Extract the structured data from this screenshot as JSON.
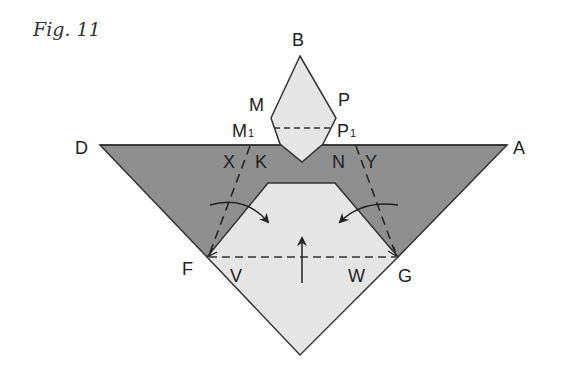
{
  "figure": {
    "title": "Fig. 11",
    "colors": {
      "dark_fill": "#8f8f8f",
      "light_fill": "#e6e6e6",
      "stroke": "#333333",
      "background": "#ffffff"
    },
    "labels": {
      "B": "B",
      "M": "M",
      "P": "P",
      "M1": "M",
      "M1_sub": "1",
      "P1": "P",
      "P1_sub": "1",
      "D": "D",
      "A": "A",
      "X": "X",
      "K": "K",
      "N": "N",
      "Y": "Y",
      "F": "F",
      "V": "V",
      "W": "W",
      "G": "G"
    }
  }
}
